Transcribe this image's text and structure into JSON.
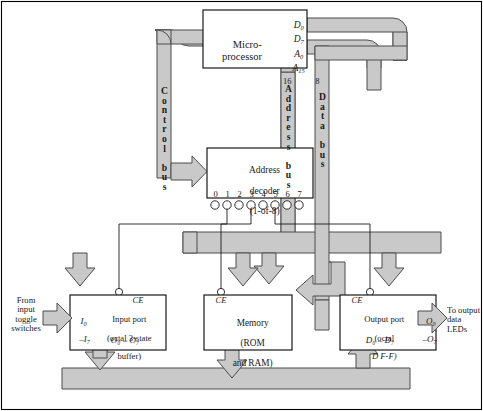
{
  "figure": {
    "colors": {
      "bus_fill": "#c9c9c9",
      "bus_stroke": "#4d4d4d",
      "box_fill": "#ffffff",
      "box_stroke": "#1a1a1a",
      "border": "#000000",
      "text": "#1a1a1a"
    }
  },
  "cpu": {
    "name": "microprocessor",
    "line1": "Micro-",
    "line2": "processor",
    "pins": {
      "data_top": "D",
      "data_top_sub": "0",
      "data_bottom": "D",
      "data_bottom_sub": "7",
      "addr_top": "A",
      "addr_top_sub": "0",
      "addr_bottom": "A",
      "addr_bottom_sub": "15"
    }
  },
  "bus_widths": {
    "address": "16",
    "data": "8"
  },
  "buses": {
    "control": "Control bus",
    "control_letters": "C\no\nn\nt\nr\no\nl\n \nb\nu\ns",
    "address": "Address bus",
    "address_letters": "A\nd\nd\nr\ne\ns\ns\n \nb\nu\ns",
    "data": "Data bus",
    "data_letters": "D\na\nt\na\n \nb\nu\ns",
    "address_right_letters": "s\nb\nu\ns"
  },
  "decoder": {
    "name": "address-decoder",
    "line1": "Address",
    "line2": "decoder",
    "line3": "(1-of-8)",
    "outputs": [
      "0",
      "1",
      "2",
      "3",
      "4",
      "5",
      "6",
      "7"
    ]
  },
  "input_port": {
    "name": "input-port",
    "title": "Input port",
    "line2": "(octal 3-state",
    "line3": "buffer)",
    "ce": "CE",
    "in_top": "I",
    "in_top_sub": "0",
    "in_bottom": "I",
    "in_bottom_sub": "7",
    "in_dash": "–",
    "out": "O",
    "out_sub_lo": "0",
    "out_sub_hi": "7",
    "out_label": "O₀ – O₇"
  },
  "memory": {
    "name": "memory",
    "line1": "Memory",
    "line2": "(ROM",
    "line3": "and RAM)",
    "ce": "CE"
  },
  "output_port": {
    "name": "output-port",
    "title": "Output port",
    "line2": "(octal",
    "line3": "D F-F)",
    "ce": "CE",
    "in_label": "D₀ – D₇",
    "out_top": "O",
    "out_top_sub": "0",
    "out_bottom": "O",
    "out_bottom_sub": "7",
    "out_dash": "–"
  },
  "io_text": {
    "from_switches": "From\ninput\ntoggle\nswitches",
    "to_leds": "To output\ndata LEDs"
  }
}
